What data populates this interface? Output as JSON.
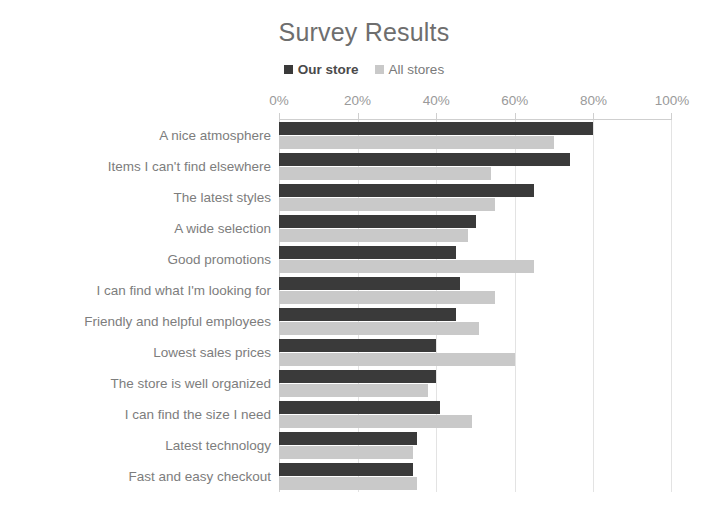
{
  "chart_data": {
    "type": "bar",
    "orientation": "horizontal",
    "title": "Survey Results",
    "xlabel": "",
    "ylabel": "",
    "xlim": [
      0,
      100
    ],
    "x_tick_labels": [
      "0%",
      "20%",
      "40%",
      "60%",
      "80%",
      "100%"
    ],
    "x_ticks": [
      0,
      20,
      40,
      60,
      80,
      100
    ],
    "grid": true,
    "grid_axis": "x",
    "legend_position": "top-center",
    "categories": [
      "A nice atmosphere",
      "Items I can't find elsewhere",
      "The latest styles",
      "A wide selection",
      "Good promotions",
      "I can find what I'm looking for",
      "Friendly and helpful employees",
      "Lowest sales prices",
      "The store is well organized",
      "I can find the size I need",
      "Latest technology",
      "Fast and easy checkout"
    ],
    "series": [
      {
        "name": "Our store",
        "color": "#3a3a3a",
        "values": [
          80,
          74,
          65,
          50,
          45,
          46,
          45,
          40,
          40,
          41,
          35,
          34
        ]
      },
      {
        "name": "All stores",
        "color": "#c9c9c9",
        "values": [
          70,
          54,
          55,
          48,
          65,
          55,
          51,
          60,
          38,
          49,
          34,
          35
        ]
      }
    ]
  },
  "colors": {
    "title_text": "#6e6e6e",
    "label_text": "#7d7d7d",
    "tick_text": "#9a9a9a",
    "gridline": "#e3e3e3",
    "axis_line": "#cfcfcf",
    "series_primary": "#3a3a3a",
    "series_secondary": "#c9c9c9",
    "background": "#ffffff"
  },
  "legend": {
    "items": [
      {
        "label": "Our store",
        "swatch_name": "legend-swatch-our-store"
      },
      {
        "label": "All stores",
        "swatch_name": "legend-swatch-all-stores"
      }
    ]
  }
}
